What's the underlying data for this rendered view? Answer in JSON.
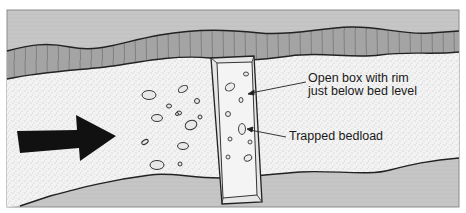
{
  "caption": {
    "top_partial_text": "...m/gauge..."
  },
  "diagram": {
    "labels": {
      "box_line1": "Open box with rim",
      "box_line2": "just below bed level",
      "bedload": "Trapped bedload"
    },
    "elements": {
      "flow_arrow": "flow-direction-arrow",
      "trap_box": "open-box-trap",
      "upper_bank": "channel-bank-upper",
      "lower_bank": "channel-bank-lower",
      "bed": "stream-bed-sediment"
    },
    "colors": {
      "frame_bg": "#c8c8c8",
      "bank_fill": "#a6a6a6",
      "bed_fill": "#f2f2f2",
      "stipple": "#8a8a8a",
      "outline": "#222222",
      "arrow": "#111111",
      "box_fill": "#ececec"
    }
  }
}
